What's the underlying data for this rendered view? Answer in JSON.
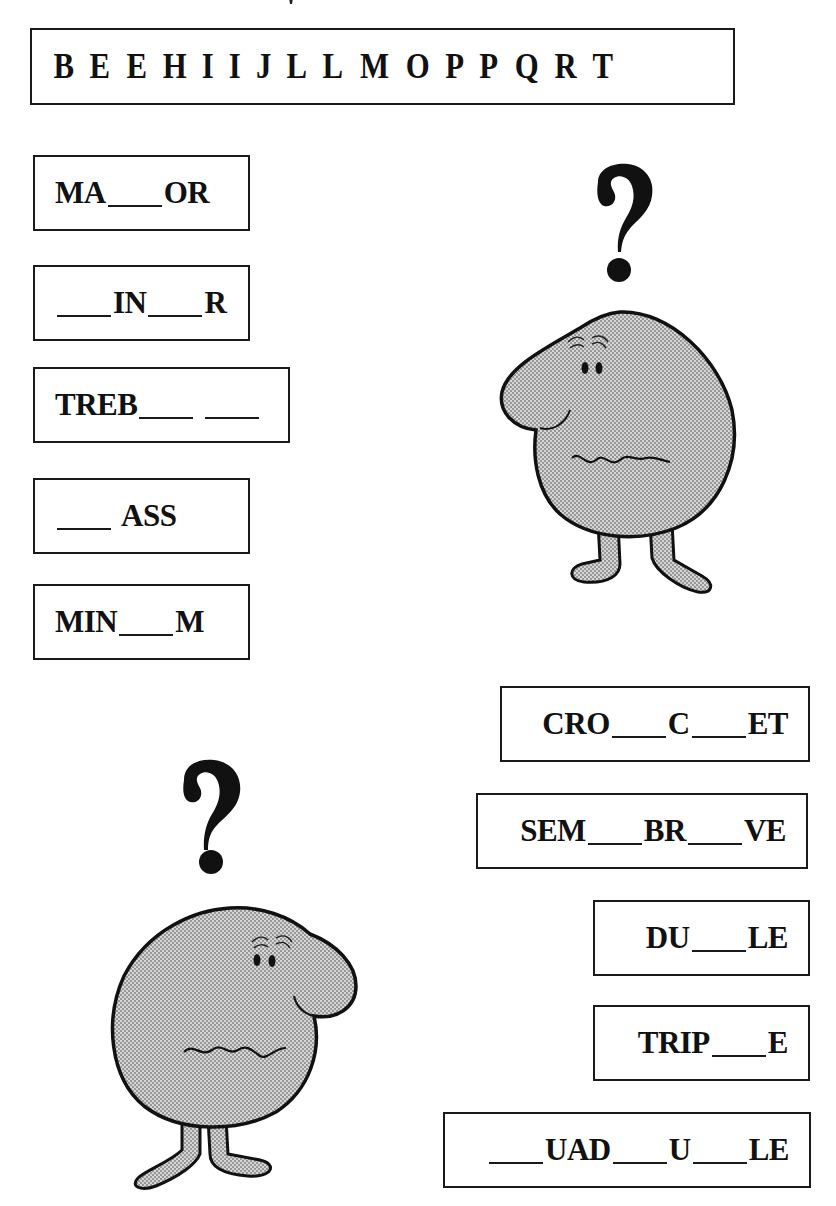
{
  "letter_bank": {
    "letters": [
      "B",
      "E",
      "E",
      "H",
      "I",
      "I",
      "J",
      "L",
      "L",
      "M",
      "O",
      "P",
      "P",
      "Q",
      "R",
      "T"
    ]
  },
  "left_words": [
    {
      "id": "ma_or",
      "parts": [
        {
          "t": "text",
          "v": "MA"
        },
        {
          "t": "blank"
        },
        {
          "t": "text",
          "v": "OR"
        }
      ]
    },
    {
      "id": "in_r",
      "parts": [
        {
          "t": "blank"
        },
        {
          "t": "text",
          "v": "IN"
        },
        {
          "t": "blank"
        },
        {
          "t": "text",
          "v": "R"
        }
      ]
    },
    {
      "id": "treb",
      "parts": [
        {
          "t": "text",
          "v": "TREB"
        },
        {
          "t": "blank"
        },
        {
          "t": "gap"
        },
        {
          "t": "blank"
        }
      ]
    },
    {
      "id": "ass",
      "parts": [
        {
          "t": "blank"
        },
        {
          "t": "gap"
        },
        {
          "t": "text",
          "v": "ASS"
        }
      ]
    },
    {
      "id": "min_m",
      "parts": [
        {
          "t": "text",
          "v": "MIN"
        },
        {
          "t": "blank"
        },
        {
          "t": "text",
          "v": "M"
        }
      ]
    }
  ],
  "right_words": [
    {
      "id": "cro_c_et",
      "parts": [
        {
          "t": "text",
          "v": "CRO"
        },
        {
          "t": "blank"
        },
        {
          "t": "text",
          "v": "C"
        },
        {
          "t": "blank"
        },
        {
          "t": "text",
          "v": "ET"
        }
      ]
    },
    {
      "id": "sem_br_ve",
      "parts": [
        {
          "t": "text",
          "v": "SEM"
        },
        {
          "t": "blank"
        },
        {
          "t": "text",
          "v": "BR"
        },
        {
          "t": "blank"
        },
        {
          "t": "text",
          "v": "VE"
        }
      ]
    },
    {
      "id": "du_le",
      "parts": [
        {
          "t": "text",
          "v": "DU"
        },
        {
          "t": "blank"
        },
        {
          "t": "text",
          "v": "LE"
        }
      ]
    },
    {
      "id": "trip_e",
      "parts": [
        {
          "t": "text",
          "v": "TRIP"
        },
        {
          "t": "blank"
        },
        {
          "t": "text",
          "v": "E"
        }
      ]
    },
    {
      "id": "uad_u_le",
      "parts": [
        {
          "t": "blank"
        },
        {
          "t": "text",
          "v": "UAD"
        },
        {
          "t": "blank"
        },
        {
          "t": "text",
          "v": "U"
        },
        {
          "t": "blank"
        },
        {
          "t": "text",
          "v": "LE"
        }
      ]
    }
  ],
  "illustrations": {
    "character_top_right": {
      "symbol": "?",
      "fill": "#bdbdbd",
      "facing": "left"
    },
    "character_bottom_left": {
      "symbol": "?",
      "fill": "#bdbdbd",
      "facing": "right"
    }
  }
}
